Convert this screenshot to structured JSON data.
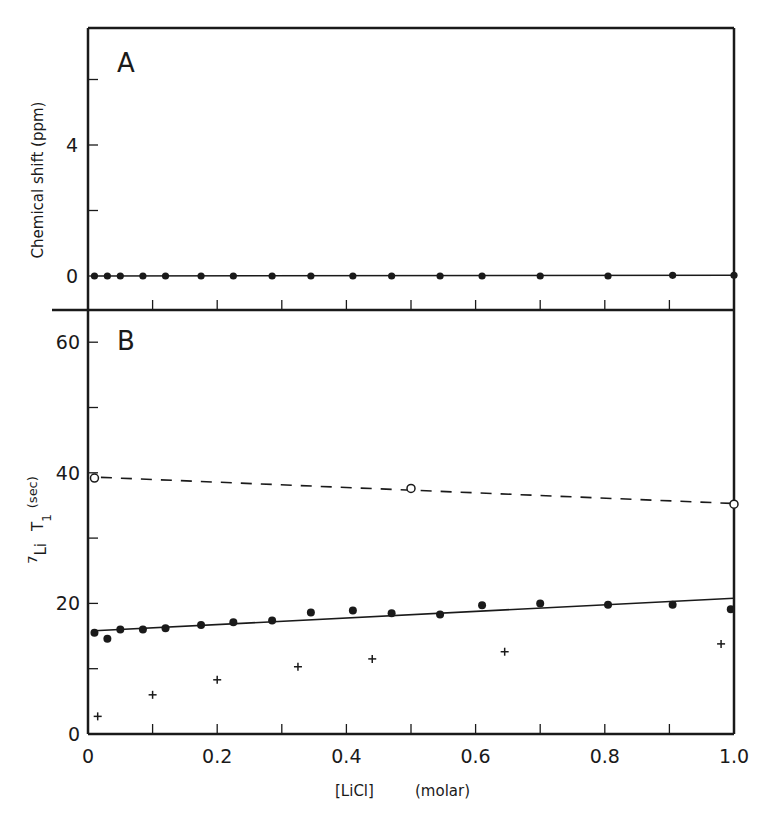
{
  "chart_data": [
    {
      "panel": "A",
      "type": "line",
      "title": "A",
      "xlabel": "[LiCl]  (molar)",
      "ylabel": "Chemical shift  (ppm)",
      "xlim": [
        0,
        1.0
      ],
      "ylim": [
        -0.9,
        7.6
      ],
      "yticks": [
        0,
        2,
        4,
        6
      ],
      "ytick_labels": [
        "0",
        "",
        "4",
        ""
      ],
      "grid": false,
      "legend": null,
      "series": [
        {
          "name": "chemical shift",
          "marker": "filled-circle",
          "line": "solid",
          "x": [
            0.01,
            0.03,
            0.05,
            0.085,
            0.12,
            0.175,
            0.225,
            0.285,
            0.345,
            0.41,
            0.47,
            0.545,
            0.61,
            0.7,
            0.805,
            0.905,
            1.0
          ],
          "y": [
            0,
            0,
            0,
            0,
            0,
            0,
            0,
            0,
            0,
            0,
            0,
            0,
            0,
            0,
            0,
            0.02,
            0.02
          ]
        }
      ]
    },
    {
      "panel": "B",
      "type": "scatter",
      "title": "B",
      "xlabel": "[LiCl]  (molar)",
      "ylabel": "7Li T1 (sec)",
      "ylabel_parts": {
        "iso_sup": "7",
        "nucleus": "Li",
        "symbol": "T",
        "sub": "1",
        "unit": "(sec)"
      },
      "xlim": [
        0,
        1.0
      ],
      "ylim": [
        0,
        65
      ],
      "xticks": [
        0,
        0.1,
        0.2,
        0.3,
        0.4,
        0.5,
        0.6,
        0.7,
        0.8,
        0.9,
        1.0
      ],
      "xtick_labels": [
        "0",
        "",
        "0.2",
        "",
        "0.4",
        "",
        "0.6",
        "",
        "0.8",
        "",
        "1.0"
      ],
      "yticks": [
        0,
        10,
        20,
        30,
        40,
        50,
        60
      ],
      "ytick_labels": [
        "0",
        "",
        "20",
        "",
        "40",
        "",
        "60"
      ],
      "grid": false,
      "legend": null,
      "series": [
        {
          "name": "open circles",
          "marker": "open-circle",
          "line": "dashed",
          "x": [
            0.01,
            0.5,
            1.0
          ],
          "y": [
            39.2,
            37.6,
            35.2
          ],
          "fit": {
            "x": [
              0.02,
              1.0
            ],
            "y": [
              39.3,
              35.3
            ]
          }
        },
        {
          "name": "filled circles",
          "marker": "filled-circle",
          "line": "solid",
          "x": [
            0.01,
            0.03,
            0.05,
            0.085,
            0.12,
            0.175,
            0.225,
            0.285,
            0.345,
            0.41,
            0.47,
            0.545,
            0.61,
            0.7,
            0.805,
            0.905,
            0.995
          ],
          "y": [
            15.5,
            14.6,
            16.0,
            16.0,
            16.2,
            16.7,
            17.1,
            17.4,
            18.6,
            18.9,
            18.5,
            18.3,
            19.7,
            20.0,
            19.8,
            19.8,
            19.1
          ],
          "fit": {
            "x": [
              0.01,
              1.0
            ],
            "y": [
              15.8,
              20.8
            ]
          }
        },
        {
          "name": "crosses",
          "marker": "plus",
          "line": "none",
          "x": [
            0.015,
            0.1,
            0.2,
            0.325,
            0.44,
            0.645,
            0.98
          ],
          "y": [
            2.7,
            6.0,
            8.3,
            10.3,
            11.5,
            12.6,
            13.8
          ]
        }
      ]
    }
  ],
  "labels": {
    "panel_a": "A",
    "panel_b": "B",
    "ylabel_a": "Chemical shift  (ppm)",
    "ylabel_b_sup": "7",
    "ylabel_b_nucleus": "Li",
    "ylabel_b_symbol": "T",
    "ylabel_b_sub": "1",
    "ylabel_b_unit": "(sec)",
    "xlabel_bracket": "[LiCl]",
    "xlabel_unit": "(molar)"
  },
  "colors": {
    "ink": "#1a1a1a",
    "background": "#ffffff"
  }
}
